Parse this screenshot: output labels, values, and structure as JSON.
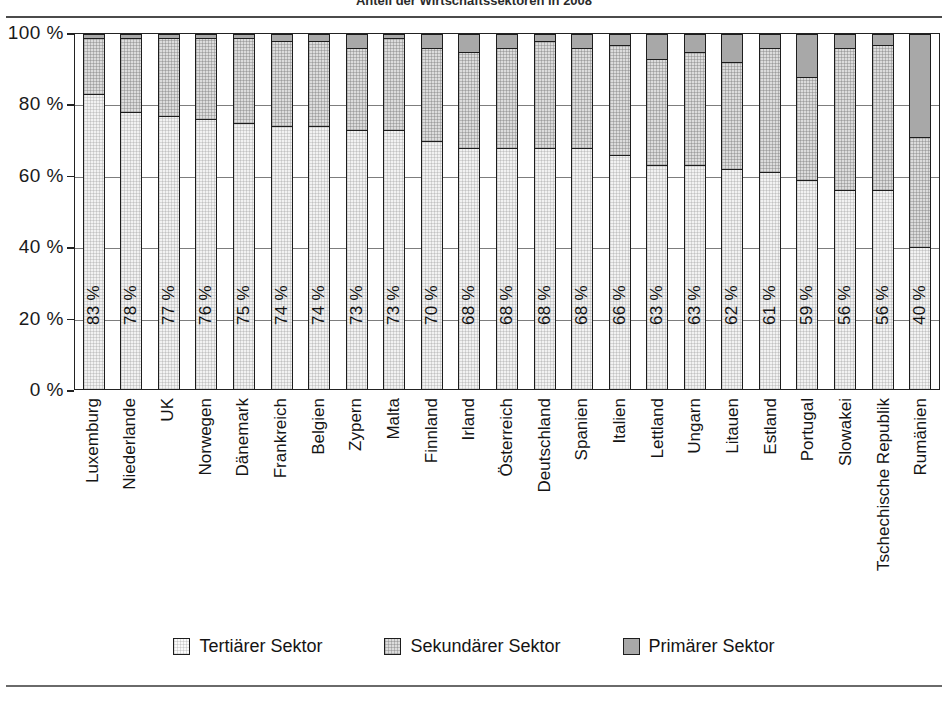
{
  "chart_data": {
    "type": "bar",
    "subtype": "100% stacked column",
    "title": "Anteil der Wirtschaftssektoren in 2008",
    "xlabel": "",
    "ylabel": "",
    "ylim": [
      0,
      100
    ],
    "ytick_labels": [
      "0 %",
      "20 %",
      "40 %",
      "60 %",
      "80 %",
      "100 %"
    ],
    "ytick_values": [
      0,
      20,
      40,
      60,
      80,
      100
    ],
    "grid": true,
    "legend_position": "bottom",
    "value_label_suffix": " %",
    "categories": [
      "Luxemburg",
      "Niederlande",
      "UK",
      "Norwegen",
      "Dänemark",
      "Frankreich",
      "Belgien",
      "Zypern",
      "Malta",
      "Finnland",
      "Irland",
      "Österreich",
      "Deutschland",
      "Spanien",
      "Italien",
      "Lettland",
      "Ungarn",
      "Litauen",
      "Estland",
      "Portugal",
      "Slowakei",
      "Tschechische Republik",
      "Rumänien"
    ],
    "series": [
      {
        "name": "Tertiärer Sektor",
        "color": "#f2f2f2",
        "values": [
          83,
          78,
          77,
          76,
          75,
          74,
          74,
          73,
          73,
          70,
          68,
          68,
          68,
          68,
          66,
          63,
          63,
          62,
          61,
          59,
          56,
          56,
          40
        ]
      },
      {
        "name": "Sekundärer Sektor",
        "color": "#dcdcdc",
        "values": [
          16,
          21,
          22,
          23,
          24,
          24,
          24,
          23,
          26,
          26,
          27,
          28,
          30,
          28,
          31,
          30,
          32,
          30,
          35,
          29,
          40,
          41,
          31
        ]
      },
      {
        "name": "Primärer Sektor",
        "color": "#a8a8a8",
        "values": [
          1,
          1,
          1,
          1,
          1,
          2,
          2,
          4,
          1,
          4,
          5,
          4,
          2,
          4,
          3,
          7,
          5,
          8,
          4,
          12,
          4,
          3,
          29
        ]
      }
    ],
    "data_labels": [
      "83 %",
      "78 %",
      "77 %",
      "76 %",
      "75 %",
      "74 %",
      "74 %",
      "73 %",
      "73 %",
      "70 %",
      "68 %",
      "68 %",
      "68 %",
      "68 %",
      "66 %",
      "63 %",
      "63 %",
      "62 %",
      "61 %",
      "59 %",
      "56 %",
      "56 %",
      "40 %"
    ]
  },
  "legend": {
    "items": [
      {
        "label": "Tertiärer Sektor",
        "swatch": "tertiary-swatch"
      },
      {
        "label": "Sekundärer Sektor",
        "swatch": "secondary-swatch"
      },
      {
        "label": "Primärer Sektor",
        "swatch": "primary-swatch"
      }
    ]
  }
}
